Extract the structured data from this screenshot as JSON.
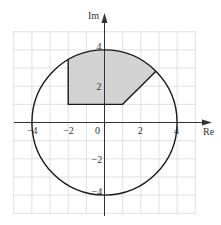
{
  "diagram": {
    "type": "argand-diagram",
    "axes": {
      "x_label": "Re",
      "y_label": "Im",
      "origin_label": "0",
      "x_ticks": [
        {
          "value": -4,
          "label": "−4"
        },
        {
          "value": -2,
          "label": "−2"
        },
        {
          "value": 2,
          "label": "2"
        },
        {
          "value": 4,
          "label": "4"
        }
      ],
      "y_ticks": [
        {
          "value": 4,
          "label": "4"
        },
        {
          "value": 2,
          "label": "2"
        },
        {
          "value": -2,
          "label": "−2"
        },
        {
          "value": -4,
          "label": "−4"
        }
      ],
      "grid_range": {
        "x": [
          -5,
          5
        ],
        "y": [
          -5,
          5
        ]
      },
      "grid_step": 1
    },
    "circle": {
      "center": [
        0,
        0
      ],
      "radius": 4
    },
    "shaded_region": {
      "description": "Region inside |z| ≤ 4 with Re(z) ≥ −2, Im(z) ≥ 1, and Im(z) ≥ Re(z)",
      "vertices": [
        [
          -2,
          1
        ],
        [
          1,
          1
        ],
        [
          2.83,
          2.83
        ],
        [
          -2,
          3.46
        ]
      ],
      "boundary_arc": "circle |z| = 4 from (2.83, 2.83) to (-2, 3.46)"
    },
    "colors": {
      "grid": "#d9d9d9",
      "axes": "#333333",
      "curve": "#1a1a1a",
      "shade": "#d3d3d3"
    }
  }
}
